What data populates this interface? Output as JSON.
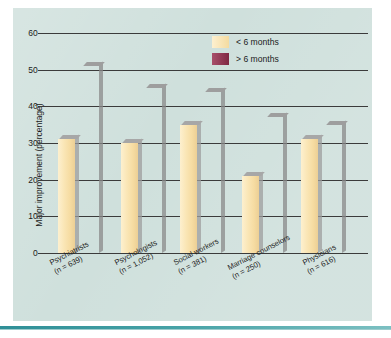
{
  "chart_data": {
    "type": "bar",
    "title": "",
    "xlabel": "",
    "ylabel": "Major improvement (percentage)",
    "ylim": [
      0,
      60
    ],
    "yticks": [
      0,
      10,
      20,
      30,
      40,
      50,
      60
    ],
    "grid": true,
    "legend_position": "top-right",
    "categories": [
      "Psychiatrists\n(n = 639)",
      "Psychologists\n(n = 1,052)",
      "Social workers\n(n = 381)",
      "Marriage counselors\n(n = 250)",
      "Physicians\n(n = 616)"
    ],
    "category_labels": [
      {
        "name": "Psychiatrists",
        "n": "(n = 639)"
      },
      {
        "name": "Psychologists",
        "n": "(n = 1,052)"
      },
      {
        "name": "Social workers",
        "n": "(n = 381)"
      },
      {
        "name": "Marriage counselors",
        "n": "(n = 250)"
      },
      {
        "name": "Physicians",
        "n": "(n = 616)"
      }
    ],
    "series": [
      {
        "name": "< 6 months",
        "color": "#f4dba0",
        "values": [
          31,
          30,
          35,
          21,
          31
        ]
      },
      {
        "name": "> 6 months",
        "color": "#8e2f4e",
        "values": [
          51,
          45,
          44,
          37,
          35
        ]
      }
    ]
  },
  "legend": {
    "items": [
      {
        "label": "< 6 months",
        "swatch": "cream"
      },
      {
        "label": "> 6 months",
        "swatch": "maroon"
      }
    ]
  },
  "axis": {
    "y_title": "Major improvement (percentage)",
    "y_ticks": [
      "60",
      "50",
      "40",
      "30",
      "20",
      "10",
      "0"
    ]
  },
  "colors": {
    "panel_background": "#cfe0dc",
    "page_background": "#ffffff",
    "rule": "#46a2a6",
    "axis": "#3b3b3b",
    "series_short": "#f4dba0",
    "series_long": "#8e2f4e"
  }
}
